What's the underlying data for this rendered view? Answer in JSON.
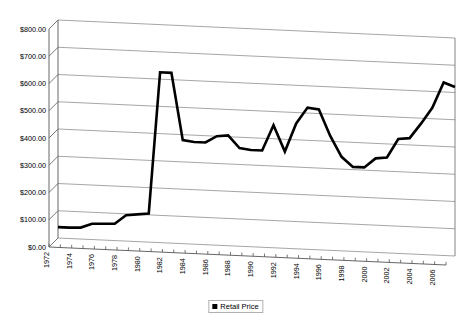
{
  "chart_data": {
    "type": "line",
    "title": "",
    "xlabel": "",
    "ylabel": "",
    "ylim": [
      0,
      800
    ],
    "ytick_step": 100,
    "grid": true,
    "legend_position": "bottom-center",
    "style": "3d-skewed-line-chart",
    "series": [
      {
        "name": "Retail Price",
        "color": "#000000",
        "x": [
          1972,
          1973,
          1974,
          1975,
          1976,
          1977,
          1978,
          1979,
          1980,
          1981,
          1982,
          1983,
          1984,
          1985,
          1986,
          1987,
          1988,
          1989,
          1990,
          1991,
          1992,
          1993,
          1994,
          1995,
          1996,
          1997,
          1998,
          1999,
          2000,
          2001,
          2002,
          2003,
          2004,
          2005,
          2006,
          2007
        ],
        "values": [
          40,
          40,
          42,
          58,
          60,
          62,
          95,
          100,
          105,
          625,
          625,
          380,
          375,
          375,
          400,
          405,
          360,
          355,
          355,
          450,
          355,
          460,
          520,
          515,
          420,
          345,
          310,
          310,
          345,
          350,
          420,
          425,
          480,
          540,
          635,
          620
        ]
      }
    ],
    "yticks": [
      "$0.00",
      "$100.00",
      "$200.00",
      "$300.00",
      "$400.00",
      "$500.00",
      "$600.00",
      "$700.00",
      "$800.00"
    ],
    "ytick_values": [
      0,
      100,
      200,
      300,
      400,
      500,
      600,
      700,
      800
    ],
    "xticks": [
      "1972",
      "1974",
      "1976",
      "1978",
      "1980",
      "1982",
      "1984",
      "1986",
      "1988",
      "1990",
      "1992",
      "1994",
      "1996",
      "1998",
      "2000",
      "2002",
      "2004",
      "2006"
    ],
    "xtick_values": [
      1972,
      1974,
      1976,
      1978,
      1980,
      1982,
      1984,
      1986,
      1988,
      1990,
      1992,
      1994,
      1996,
      1998,
      2000,
      2002,
      2004,
      2006
    ]
  },
  "legend": {
    "entries": [
      {
        "label": "Retail Price",
        "color": "#000000"
      }
    ]
  }
}
